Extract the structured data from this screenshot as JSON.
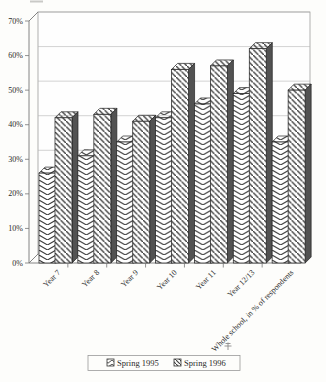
{
  "chart_data": {
    "type": "bar",
    "style": "3d-monochrome-hatched-scan",
    "title": "",
    "xlabel": "",
    "ylabel": "",
    "ylim": [
      0,
      70
    ],
    "ytick_step": 10,
    "ytick_labels": [
      "0%",
      "10%",
      "20%",
      "30%",
      "40%",
      "50%",
      "60%",
      "70%"
    ],
    "grid": true,
    "legend_position": "bottom",
    "categories": [
      "Year 7",
      "Year 8",
      "Year 9",
      "Year 10",
      "Year 11",
      "Year 12/13",
      "Whole school, in % of respondents"
    ],
    "series": [
      {
        "name": "Spring 1995",
        "pattern": "herringbone-chevron",
        "values": [
          26,
          31,
          35,
          42,
          46,
          49,
          35
        ]
      },
      {
        "name": "Spring 1996",
        "pattern": "diagonal-stripes",
        "values": [
          42,
          43,
          41,
          56,
          57,
          62,
          50
        ]
      }
    ],
    "units": "% of respondents"
  },
  "colors": {
    "paper": "#fdfdfb",
    "wall_fill": "#fefefe",
    "gridline": "#b5b5b5",
    "axis": "#777777",
    "bar_outline": "#222222",
    "hatch_ink": "#3d3d3d",
    "bar_side_face": "#525252",
    "legend_border": "#999999",
    "text_ink": "#2a2a2a"
  },
  "legend": {
    "items": [
      {
        "label": "Spring 1995",
        "marker": "herringbone-swatch"
      },
      {
        "label": "Spring 1996",
        "marker": "diagonal-swatch"
      }
    ]
  }
}
